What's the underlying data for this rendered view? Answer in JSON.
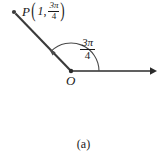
{
  "figure": {
    "caption": "(a)",
    "stroke_color": "#2b2b2b",
    "text_color": "#1a1a1a",
    "background_color": "#ffffff"
  },
  "point_label": {
    "name": "P",
    "open_paren": "(",
    "close_paren": ")",
    "radius": "1",
    "comma": ",",
    "angle_numerator": "3π",
    "angle_denominator": "4"
  },
  "angle_label": {
    "numerator": "3π",
    "denominator": "4"
  },
  "origin_label": {
    "name": "O"
  },
  "geometry": {
    "origin_x": 71,
    "origin_y": 71,
    "point_x": 14,
    "point_y": 12,
    "polar_axis_end_x": 155,
    "arc_radius": 28,
    "angle_degrees": 135
  }
}
